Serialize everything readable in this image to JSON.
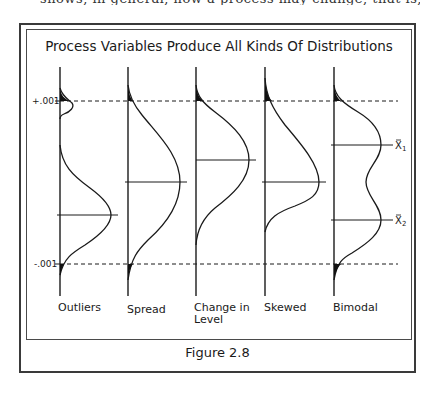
{
  "figure": {
    "title": "Process Variables Produce All Kinds Of Distributions",
    "caption": "Figure 2.8",
    "top_cropped_text": "shows, in general, how a process may change, that is, the distributions"
  },
  "limits": {
    "upper_label": "+.001",
    "lower_label": "-.001"
  },
  "distributions": [
    {
      "name": "outliers",
      "label": "Outliers"
    },
    {
      "name": "spread",
      "label": "Spread"
    },
    {
      "name": "change-in-level",
      "label": "Change in Level",
      "label_line1": "Change in",
      "label_line2": "Level"
    },
    {
      "name": "skewed",
      "label": "Skewed"
    },
    {
      "name": "bimodal",
      "label": "Bimodal",
      "mean_labels": [
        "X̄1",
        "X̄2"
      ]
    }
  ],
  "bimodal_means": {
    "x1_label": "X",
    "x1_sub": "1",
    "x2_label": "X",
    "x2_sub": "2"
  }
}
